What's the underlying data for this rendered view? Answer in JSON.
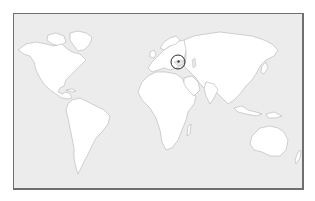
{
  "map": {
    "type": "world-outline-map",
    "projection": "equirectangular-style",
    "colors": {
      "ocean": "#ececec",
      "land": "#ffffff",
      "coastline": "#b4b4b4",
      "frame_border": "#6f6f6f",
      "marker": "#2a2a2a"
    },
    "continents": [
      "north-america",
      "south-america",
      "europe",
      "africa",
      "asia",
      "australia",
      "greenland"
    ],
    "marker": {
      "shape": "circle",
      "region": "Black Sea / Crimea",
      "cx": 178,
      "cy": 62,
      "r": 7
    }
  }
}
